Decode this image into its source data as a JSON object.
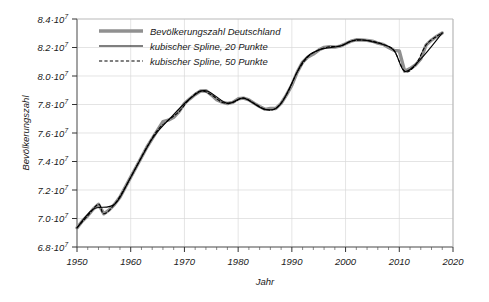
{
  "chart_data": {
    "type": "line",
    "title": "",
    "xlabel": "Jahr",
    "ylabel": "Bevölkerungszahl",
    "xlim": [
      1950,
      2020
    ],
    "ylim": [
      68000000,
      84000000
    ],
    "grid": true,
    "legend_position": "top-left-inside",
    "x_tick_labels": [
      "1950",
      "1960",
      "1970",
      "1980",
      "1990",
      "2000",
      "2010",
      "2020"
    ],
    "x_ticks": [
      1950,
      1960,
      1970,
      1980,
      1990,
      2000,
      2010,
      2020
    ],
    "x_minor_tick_step": 2,
    "y_ticks": [
      68000000,
      70000000,
      72000000,
      74000000,
      76000000,
      78000000,
      80000000,
      82000000,
      84000000
    ],
    "y_tick_labels": [
      {
        "mantissa": "6.8·10",
        "exponent": "7"
      },
      {
        "mantissa": "7.0·10",
        "exponent": "7"
      },
      {
        "mantissa": "7.2·10",
        "exponent": "7"
      },
      {
        "mantissa": "7.4·10",
        "exponent": "7"
      },
      {
        "mantissa": "7.6·10",
        "exponent": "7"
      },
      {
        "mantissa": "7.8·10",
        "exponent": "7"
      },
      {
        "mantissa": "8.0·10",
        "exponent": "7"
      },
      {
        "mantissa": "8.2·10",
        "exponent": "7"
      },
      {
        "mantissa": "8.4·10",
        "exponent": "7"
      }
    ],
    "legend": [
      {
        "label": "Bevölkerungszahl Deutschland",
        "style": "solid-thick",
        "color": "#909090",
        "width": 3.4
      },
      {
        "label": "kubischer Spline, 20 Punkte",
        "style": "solid-thin",
        "color": "#000000",
        "width": 1.1
      },
      {
        "label": "kubischer Spline, 50 Punkte",
        "style": "dashed",
        "color": "#000000",
        "width": 1.1
      }
    ],
    "series": [
      {
        "name": "Bevölkerungszahl Deutschland",
        "x": [
          1950,
          1951,
          1952,
          1953,
          1954,
          1955,
          1956,
          1957,
          1958,
          1959,
          1960,
          1961,
          1962,
          1963,
          1964,
          1965,
          1966,
          1967,
          1968,
          1969,
          1970,
          1971,
          1972,
          1973,
          1974,
          1975,
          1976,
          1977,
          1978,
          1979,
          1980,
          1981,
          1982,
          1983,
          1984,
          1985,
          1986,
          1987,
          1988,
          1989,
          1990,
          1991,
          1992,
          1993,
          1994,
          1995,
          1996,
          1997,
          1998,
          1999,
          2000,
          2001,
          2002,
          2003,
          2004,
          2005,
          2006,
          2007,
          2008,
          2009,
          2010,
          2011,
          2012,
          2013,
          2014,
          2015,
          2016,
          2017,
          2018
        ],
        "values": [
          69346000,
          69820000,
          70196000,
          70651000,
          71000000,
          70330000,
          70600000,
          71000000,
          71500000,
          72200000,
          72900000,
          73600000,
          74300000,
          75000000,
          75600000,
          76200000,
          76800000,
          76900000,
          77100000,
          77500000,
          78070000,
          78400000,
          78700000,
          78950000,
          78970000,
          78680000,
          78340000,
          78160000,
          78070000,
          78150000,
          78400000,
          78450000,
          78330000,
          78080000,
          77860000,
          77660000,
          77720000,
          77720000,
          78080000,
          78680000,
          79360000,
          80270000,
          80970000,
          81340000,
          81540000,
          81820000,
          82010000,
          82050000,
          82030000,
          82100000,
          82260000,
          82440000,
          82540000,
          82530000,
          82500000,
          82440000,
          82310000,
          82220000,
          82000000,
          81800000,
          81750000,
          80330000,
          80520000,
          80770000,
          81200000,
          82180000,
          82520000,
          82790000,
          83020000
        ],
        "style": "solid-thick",
        "color": "#909090"
      },
      {
        "name": "kubischer Spline, 20 Punkte",
        "x": [
          1950,
          1953,
          1957,
          1960,
          1964,
          1967,
          1971,
          1974,
          1978,
          1981,
          1985,
          1988,
          1992,
          1995,
          1999,
          2002,
          2006,
          2009,
          2011,
          2014,
          2018
        ],
        "values": [
          69346000,
          70651000,
          71000000,
          72900000,
          75600000,
          76900000,
          78400000,
          78970000,
          78070000,
          78450000,
          77660000,
          78080000,
          80970000,
          81820000,
          82100000,
          82540000,
          82310000,
          81800000,
          80330000,
          81200000,
          83020000
        ],
        "style": "solid-thin",
        "color": "#000000"
      },
      {
        "name": "kubischer Spline, 50 Punkte",
        "x": [
          1950,
          1952,
          1954,
          1955,
          1957,
          1959,
          1961,
          1963,
          1965,
          1967,
          1969,
          1971,
          1973,
          1975,
          1977,
          1979,
          1981,
          1983,
          1985,
          1987,
          1989,
          1991,
          1993,
          1995,
          1997,
          1999,
          2001,
          2003,
          2005,
          2007,
          2009,
          2011,
          2013,
          2015,
          2017,
          2018
        ],
        "values": [
          69346000,
          70196000,
          71000000,
          70330000,
          71000000,
          72200000,
          73600000,
          75000000,
          76200000,
          76900000,
          77500000,
          78400000,
          78950000,
          78680000,
          78160000,
          78150000,
          78450000,
          78080000,
          77660000,
          77720000,
          78680000,
          80270000,
          81340000,
          81820000,
          82050000,
          82100000,
          82440000,
          82530000,
          82440000,
          82220000,
          81800000,
          80330000,
          80770000,
          82180000,
          82790000,
          83020000
        ],
        "style": "dashed",
        "color": "#000000"
      }
    ]
  }
}
